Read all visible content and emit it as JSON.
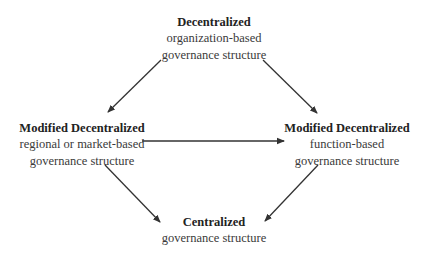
{
  "diagram": {
    "type": "flow",
    "nodes": {
      "top": {
        "title": "Decentralized",
        "line1": "organization-based",
        "line2": "governance structure"
      },
      "left": {
        "title": "Modified Decentralized",
        "line1": "regional or market-based",
        "line2": "governance structure"
      },
      "right": {
        "title": "Modified Decentralized",
        "line1": "function-based",
        "line2": "governance structure"
      },
      "bottom": {
        "title": "Centralized",
        "line1": "governance structure"
      }
    },
    "edges": [
      {
        "from": "top",
        "to": "left"
      },
      {
        "from": "top",
        "to": "right"
      },
      {
        "from": "left",
        "to": "right"
      },
      {
        "from": "left",
        "to": "bottom"
      },
      {
        "from": "right",
        "to": "bottom"
      }
    ],
    "colors": {
      "arrow": "#333333",
      "text": "#333333",
      "background": "#ffffff"
    }
  }
}
